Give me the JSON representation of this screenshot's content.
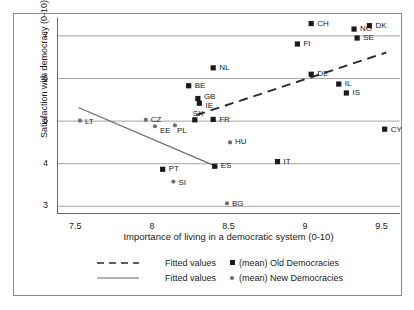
{
  "chart_data": {
    "type": "scatter",
    "title": "",
    "xlabel": "Importance of living in a democratic system (0-10)",
    "ylabel": "Satisfaction with democracy (0-10)",
    "xlim": [
      7.38,
      9.62
    ],
    "ylim": [
      2.82,
      7.42
    ],
    "xticks": [
      "7.5",
      "8",
      "8.5",
      "9",
      "9.5"
    ],
    "xtick_values": [
      7.5,
      8,
      8.5,
      9,
      9.5
    ],
    "yticks": [
      "3",
      "4",
      "5",
      "6",
      "7"
    ],
    "ytick_values": [
      3,
      4,
      5,
      6,
      7
    ],
    "grid": "horizontal",
    "legend_position": "below-axis",
    "colors": {
      "old_marker": "#1a1a1a",
      "new_marker": "#6e6e6e",
      "gridline": "#9a9a9a",
      "axis": "#6a6a6a",
      "fit_old": "#2a2a2a",
      "fit_new": "#6a6a6a"
    },
    "series": [
      {
        "name": "(mean) Old Democracies",
        "marker": "square",
        "color": "#1a1a1a",
        "points": [
          {
            "label": "CH",
            "x": 9.04,
            "y": 7.29,
            "lx": 6,
            "ly": -4
          },
          {
            "label": "DK",
            "x": 9.42,
            "y": 7.24,
            "lx": 6,
            "ly": -4
          },
          {
            "label": "NO",
            "x": 9.32,
            "y": 7.16,
            "lx": 6,
            "ly": -4
          },
          {
            "label": "SE",
            "x": 9.34,
            "y": 6.95,
            "lx": 6,
            "ly": -4
          },
          {
            "label": "FI",
            "x": 8.95,
            "y": 6.81,
            "lx": 6,
            "ly": -4
          },
          {
            "label": "NL",
            "x": 8.4,
            "y": 6.25,
            "lx": 6,
            "ly": -4
          },
          {
            "label": "DE",
            "x": 9.04,
            "y": 6.1,
            "lx": 6,
            "ly": -4
          },
          {
            "label": "IL",
            "x": 9.22,
            "y": 5.87,
            "lx": 6,
            "ly": -4
          },
          {
            "label": "BE",
            "x": 8.24,
            "y": 5.83,
            "lx": 6,
            "ly": -4
          },
          {
            "label": "IS",
            "x": 9.27,
            "y": 5.66,
            "lx": 6,
            "ly": -4
          },
          {
            "label": "GB",
            "x": 8.3,
            "y": 5.53,
            "lx": 6,
            "ly": -6
          },
          {
            "label": "IE",
            "x": 8.31,
            "y": 5.42,
            "lx": 6,
            "ly": -1
          },
          {
            "label": "FR",
            "x": 8.4,
            "y": 5.04,
            "lx": 6,
            "ly": -3
          },
          {
            "label": "SK",
            "x": 8.28,
            "y": 5.03,
            "lx": -2,
            "ly": -10
          },
          {
            "label": "CY",
            "x": 9.52,
            "y": 4.81,
            "lx": 6,
            "ly": -3
          },
          {
            "label": "IT",
            "x": 8.82,
            "y": 4.05,
            "lx": 6,
            "ly": -4
          },
          {
            "label": "ES",
            "x": 8.41,
            "y": 3.94,
            "lx": 6,
            "ly": -4
          },
          {
            "label": "PT",
            "x": 8.07,
            "y": 3.87,
            "lx": 6,
            "ly": -4
          }
        ]
      },
      {
        "name": "(mean) New Democracies",
        "marker": "circle",
        "color": "#6e6e6e",
        "points": [
          {
            "label": "LT",
            "x": 7.53,
            "y": 5.01,
            "lx": 5,
            "ly": -3
          },
          {
            "label": "CZ",
            "x": 7.96,
            "y": 5.03,
            "lx": 5,
            "ly": -4
          },
          {
            "label": "PL",
            "x": 8.15,
            "y": 4.9,
            "lx": 2,
            "ly": 2
          },
          {
            "label": "EE",
            "x": 8.02,
            "y": 4.88,
            "lx": 5,
            "ly": 1
          },
          {
            "label": "HU",
            "x": 8.51,
            "y": 4.5,
            "lx": 5,
            "ly": -4
          },
          {
            "label": "SI",
            "x": 8.14,
            "y": 3.58,
            "lx": 5,
            "ly": -3
          },
          {
            "label": "BG",
            "x": 8.49,
            "y": 3.07,
            "lx": 5,
            "ly": -3
          }
        ]
      }
    ],
    "fits": [
      {
        "name": "Fitted values (Old Democracies)",
        "style": "dashed",
        "color": "#2a2a2a",
        "x0": 8.29,
        "y0": 5.14,
        "x1": 9.53,
        "y1": 6.61
      },
      {
        "name": "Fitted values (New Democracies)",
        "style": "solid",
        "color": "#6a6a6a",
        "x0": 7.52,
        "y0": 5.32,
        "x1": 8.43,
        "y1": 3.92
      }
    ]
  },
  "legend": {
    "rows": [
      {
        "line_style": "dashed",
        "fit_label": "Fitted values",
        "marker": "square",
        "series_label": "(mean) Old Democracies"
      },
      {
        "line_style": "solid",
        "fit_label": "Fitted values",
        "marker": "circle",
        "series_label": "(mean) New Democracies"
      }
    ]
  }
}
